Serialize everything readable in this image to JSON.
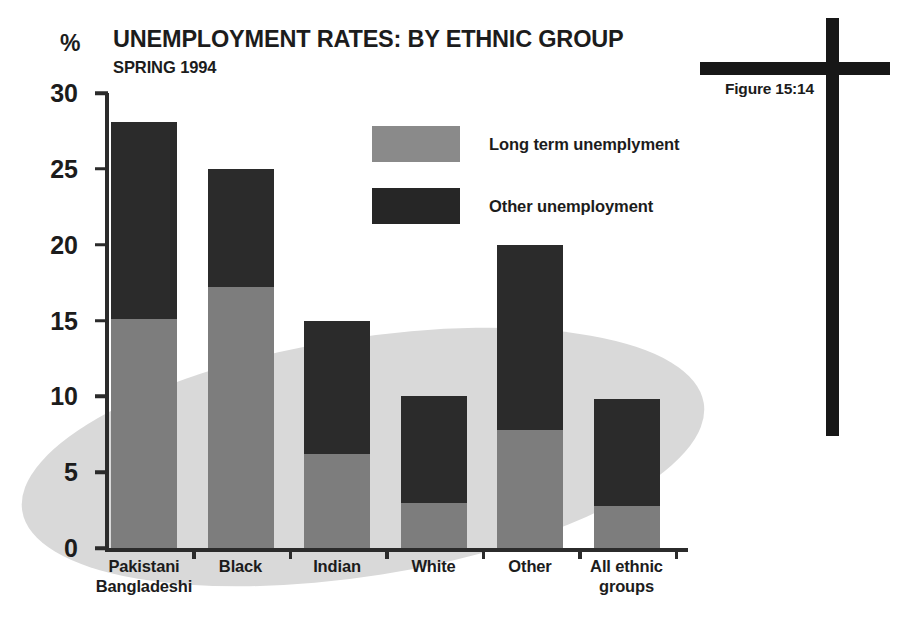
{
  "figure": {
    "label": "Figure 15:14",
    "marker_icon": "cross-icon"
  },
  "chart_data": {
    "type": "bar",
    "subtype": "stacked-bar",
    "title": "UNEMPLOYMENT RATES: BY ETHNIC GROUP",
    "subtitle": "SPRING 1994",
    "xlabel": "",
    "ylabel": "%",
    "ylim": [
      0,
      30
    ],
    "yticks": [
      0,
      5,
      10,
      15,
      20,
      25,
      30
    ],
    "ytick_labels": [
      "0",
      "5",
      "10",
      "15",
      "20",
      "25",
      "30"
    ],
    "grid": false,
    "legend_position": "upper-center",
    "categories": [
      "Pakistani\nBangladeshi",
      "Black",
      "Indian",
      "White",
      "Other",
      "All ethnic\ngroups"
    ],
    "category_lines": [
      [
        "Pakistani",
        "Bangladeshi"
      ],
      [
        "Black"
      ],
      [
        "Indian"
      ],
      [
        "White"
      ],
      [
        "Other"
      ],
      [
        "All ethnic",
        "groups"
      ]
    ],
    "series": [
      {
        "name": "Long term unemplyment",
        "color": "#7d7d7d",
        "values": [
          15.1,
          17.2,
          6.2,
          3.0,
          7.8,
          2.8
        ]
      },
      {
        "name": "Other unemployment",
        "color": "#2b2b2b",
        "values": [
          13.0,
          7.8,
          8.8,
          7.0,
          12.2,
          7.0
        ]
      }
    ],
    "totals": [
      28.1,
      25.0,
      15.0,
      10.0,
      20.0,
      9.8
    ]
  },
  "legend": {
    "items": [
      {
        "label": "Long term unemplyment",
        "swatch": "long"
      },
      {
        "label": "Other unemployment",
        "swatch": "other"
      }
    ]
  },
  "colors": {
    "long_term": "#7d7d7d",
    "other": "#2b2b2b",
    "axis": "#2b2b2b",
    "text": "#1c1c1c",
    "background_ellipse": "#d9d9d9",
    "page_background": "#ffffff"
  }
}
